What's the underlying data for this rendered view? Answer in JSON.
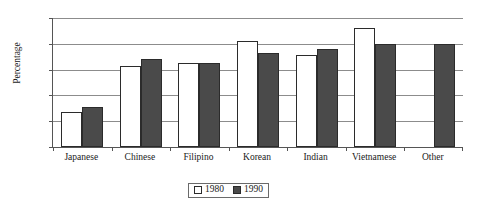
{
  "chart_data": {
    "type": "bar",
    "title": "",
    "xlabel": "",
    "ylabel": "Percentage",
    "ylim": [
      0,
      100
    ],
    "yticks": [
      0,
      20,
      40,
      60,
      80,
      100
    ],
    "grid": true,
    "legend_position": "bottom-center",
    "categories": [
      "Japanese",
      "Chinese",
      "Filipino",
      "Korean",
      "Indian",
      "Vietnamese",
      "Other"
    ],
    "series": [
      {
        "name": "1980",
        "color": "#ffffff",
        "values": [
          27,
          63,
          65,
          82,
          71,
          92,
          null
        ]
      },
      {
        "name": "1990",
        "color": "#4a4a4a",
        "values": [
          31,
          68,
          65,
          73,
          76,
          80,
          80
        ]
      }
    ]
  },
  "axes": {
    "y_title": "Percentage",
    "y_tick_labels": [
      "100",
      "80",
      "60",
      "40",
      "20",
      "0"
    ]
  },
  "legend": {
    "items": [
      {
        "label": "1980",
        "swatch": "white-square-swatch"
      },
      {
        "label": "1990",
        "swatch": "dark-square-swatch"
      }
    ]
  },
  "colors": {
    "series_1980": "#ffffff",
    "series_1990": "#4a4a4a",
    "bar_outline": "#2b2b2b",
    "gridline": "#8c8c8c",
    "axis": "#555555",
    "background": "#ffffff"
  }
}
